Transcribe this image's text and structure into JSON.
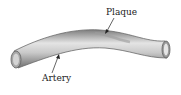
{
  "diagram": {
    "labels": {
      "plaque": "Plaque",
      "artery": "Artery"
    },
    "colors": {
      "vessel": "#8f8f8f",
      "vessel_light": "#d9d9d9",
      "plaque": "#b8b8b8",
      "text": "#222222"
    }
  }
}
